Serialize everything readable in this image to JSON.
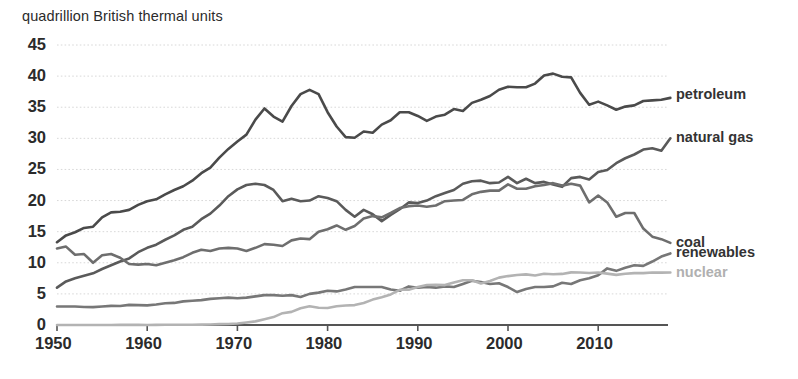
{
  "chart_data": {
    "type": "line",
    "title": "quadrillion British thermal units",
    "xlabel": "",
    "ylabel": "",
    "xlim": [
      1950,
      2018
    ],
    "ylim": [
      0,
      45
    ],
    "ytick_values": [
      0,
      5,
      10,
      15,
      20,
      25,
      30,
      35,
      40,
      45
    ],
    "ytick_labels": [
      "0",
      "5",
      "10",
      "15",
      "20",
      "25",
      "30",
      "35",
      "40",
      "45"
    ],
    "xtick_values": [
      1950,
      1960,
      1970,
      1980,
      1990,
      2000,
      2010
    ],
    "xtick_labels": [
      "1950",
      "1960",
      "1970",
      "1980",
      "1990",
      "2000",
      "2010"
    ],
    "grid": "horizontal-dotted",
    "legend_position": "right-inline-end-of-line",
    "x": [
      1950,
      1951,
      1952,
      1953,
      1954,
      1955,
      1956,
      1957,
      1958,
      1959,
      1960,
      1961,
      1962,
      1963,
      1964,
      1965,
      1966,
      1967,
      1968,
      1969,
      1970,
      1971,
      1972,
      1973,
      1974,
      1975,
      1976,
      1977,
      1978,
      1979,
      1980,
      1981,
      1982,
      1983,
      1984,
      1985,
      1986,
      1987,
      1988,
      1989,
      1990,
      1991,
      1992,
      1993,
      1994,
      1995,
      1996,
      1997,
      1998,
      1999,
      2000,
      2001,
      2002,
      2003,
      2004,
      2005,
      2006,
      2007,
      2008,
      2009,
      2010,
      2011,
      2012,
      2013,
      2014,
      2015,
      2016,
      2017,
      2018
    ],
    "series": [
      {
        "name": "petroleum",
        "color": "#4a4a4a",
        "label_y_value": 36.9,
        "values": [
          13.3,
          14.4,
          14.9,
          15.6,
          15.8,
          17.3,
          18.1,
          18.2,
          18.5,
          19.3,
          19.9,
          20.2,
          21.0,
          21.7,
          22.3,
          23.2,
          24.4,
          25.3,
          26.9,
          28.3,
          29.5,
          30.6,
          33.0,
          34.8,
          33.5,
          32.7,
          35.2,
          37.1,
          37.8,
          37.1,
          34.2,
          31.9,
          30.2,
          30.1,
          31.1,
          30.9,
          32.2,
          32.9,
          34.2,
          34.2,
          33.6,
          32.8,
          33.5,
          33.8,
          34.7,
          34.4,
          35.7,
          36.2,
          36.8,
          37.8,
          38.3,
          38.2,
          38.2,
          38.8,
          40.1,
          40.4,
          39.9,
          39.8,
          37.3,
          35.4,
          35.9,
          35.3,
          34.6,
          35.1,
          35.3,
          36.0,
          36.1,
          36.2,
          36.5
        ]
      },
      {
        "name": "natural gas",
        "color": "#5a5a5a",
        "label_y_value": 30.0,
        "values": [
          6.0,
          7.0,
          7.5,
          7.9,
          8.3,
          9.0,
          9.6,
          10.2,
          10.7,
          11.7,
          12.4,
          12.9,
          13.7,
          14.4,
          15.3,
          15.8,
          17.0,
          17.9,
          19.2,
          20.7,
          21.8,
          22.5,
          22.7,
          22.5,
          21.7,
          19.9,
          20.3,
          19.9,
          20.0,
          20.7,
          20.4,
          19.9,
          18.5,
          17.4,
          18.5,
          17.8,
          16.7,
          17.7,
          18.6,
          19.7,
          19.6,
          20.0,
          20.7,
          21.2,
          21.7,
          22.7,
          23.1,
          23.2,
          22.8,
          22.9,
          23.8,
          22.8,
          23.5,
          22.8,
          23.0,
          22.6,
          22.2,
          23.6,
          23.8,
          23.4,
          24.6,
          24.9,
          26.0,
          26.8,
          27.4,
          28.2,
          28.4,
          28.0,
          30.0
        ]
      },
      {
        "name": "coal",
        "color": "#6e6e6e",
        "label_y_value": 13.2,
        "values": [
          12.3,
          12.6,
          11.3,
          11.4,
          10.0,
          11.2,
          11.4,
          10.8,
          9.8,
          9.7,
          9.8,
          9.6,
          10.0,
          10.4,
          10.9,
          11.6,
          12.1,
          11.9,
          12.3,
          12.4,
          12.3,
          11.9,
          12.4,
          13.0,
          12.9,
          12.7,
          13.6,
          13.9,
          13.8,
          15.0,
          15.4,
          16.0,
          15.3,
          15.9,
          17.1,
          17.5,
          17.3,
          18.0,
          18.8,
          19.1,
          19.2,
          19.0,
          19.2,
          19.9,
          20.0,
          20.1,
          21.0,
          21.4,
          21.6,
          21.6,
          22.6,
          21.9,
          21.9,
          22.3,
          22.5,
          22.8,
          22.4,
          22.7,
          22.4,
          19.7,
          20.8,
          19.7,
          17.4,
          18.0,
          18.0,
          15.5,
          14.2,
          13.8,
          13.2
        ]
      },
      {
        "name": "renewables",
        "color": "#777777",
        "label_y_value": 11.5,
        "values": [
          2.98,
          2.97,
          2.97,
          2.9,
          2.88,
          2.98,
          3.08,
          3.06,
          3.24,
          3.2,
          3.15,
          3.3,
          3.5,
          3.55,
          3.8,
          3.9,
          4.0,
          4.2,
          4.3,
          4.4,
          4.3,
          4.4,
          4.6,
          4.8,
          4.8,
          4.7,
          4.8,
          4.5,
          5.0,
          5.2,
          5.5,
          5.4,
          5.7,
          6.1,
          6.1,
          6.1,
          6.1,
          5.7,
          5.5,
          6.2,
          6.0,
          6.1,
          6.0,
          6.2,
          6.1,
          6.6,
          7.1,
          6.9,
          6.6,
          6.7,
          6.1,
          5.3,
          5.8,
          6.1,
          6.1,
          6.2,
          6.8,
          6.6,
          7.2,
          7.5,
          8.0,
          9.1,
          8.7,
          9.2,
          9.6,
          9.5,
          10.2,
          11.0,
          11.5
        ]
      },
      {
        "name": "nuclear",
        "color": "#b3b3b3",
        "label_y_value": 8.4,
        "values": [
          0.0,
          0.0,
          0.0,
          0.0,
          0.0,
          0.0,
          0.0,
          0.02,
          0.02,
          0.02,
          0.01,
          0.02,
          0.03,
          0.04,
          0.04,
          0.04,
          0.06,
          0.09,
          0.14,
          0.15,
          0.24,
          0.41,
          0.58,
          0.91,
          1.27,
          1.9,
          2.11,
          2.7,
          3.02,
          2.78,
          2.74,
          3.01,
          3.13,
          3.2,
          3.55,
          4.08,
          4.47,
          4.91,
          5.66,
          5.68,
          6.1,
          6.42,
          6.48,
          6.41,
          6.84,
          7.18,
          7.19,
          6.68,
          7.07,
          7.61,
          7.86,
          8.03,
          8.14,
          7.96,
          8.23,
          8.16,
          8.21,
          8.46,
          8.43,
          8.36,
          8.43,
          8.26,
          8.06,
          8.24,
          8.34,
          8.34,
          8.43,
          8.42,
          8.44
        ]
      }
    ]
  },
  "axis": {
    "baseline_color": "#555555"
  }
}
